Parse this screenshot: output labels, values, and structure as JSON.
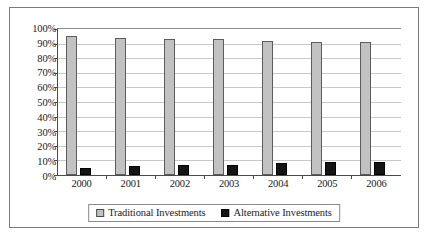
{
  "chart_data": {
    "type": "bar",
    "title": "",
    "subtitle": "",
    "xlabel": "",
    "ylabel": "",
    "categories": [
      "2000",
      "2001",
      "2002",
      "2003",
      "2004",
      "2005",
      "2006"
    ],
    "series": [
      {
        "name": "Traditional Investments",
        "color": "#c2c2c2",
        "values": [
          95,
          94,
          93,
          93,
          92,
          91,
          91
        ]
      },
      {
        "name": "Alternative Investments",
        "color": "#141414",
        "values": [
          5,
          6,
          7,
          7,
          8,
          9,
          9
        ]
      }
    ],
    "ylim": [
      0,
      100
    ],
    "ytick_values": [
      0,
      10,
      20,
      30,
      40,
      50,
      60,
      70,
      80,
      90,
      100
    ],
    "ytick_labels": [
      "0%",
      "10%",
      "20%",
      "30%",
      "40%",
      "50%",
      "60%",
      "70%",
      "80%",
      "90%",
      "100%"
    ],
    "grid": true,
    "grid_axis": "y",
    "legend_position": "bottom",
    "value_suffix": "%"
  },
  "legend": {
    "entries": [
      {
        "label": "Traditional Investments",
        "swatch": "gray-square-icon"
      },
      {
        "label": "Alternative Investments",
        "swatch": "black-square-icon"
      }
    ]
  },
  "colors": {
    "traditional": "#c2c2c2",
    "alternative": "#141414",
    "gridline": "#c8c8c8",
    "axis": "#4a4a4a",
    "frame": "#7a7a7a",
    "background": "#ffffff",
    "text": "#1a1a1a"
  }
}
